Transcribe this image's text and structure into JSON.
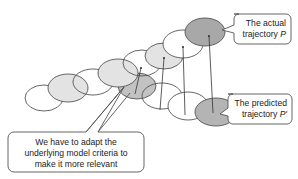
{
  "diagram": {
    "colors": {
      "stroke": "#555555",
      "white_fill": "#ffffff",
      "light_fill": "#e4e4e4",
      "dark_fill": "#a8a8a8",
      "callout_border": "#555555",
      "text": "#222222"
    },
    "callouts": {
      "actual": {
        "line1": "The actual",
        "line2_prefix": "trajectory ",
        "line2_symbol": "P"
      },
      "predicted": {
        "line1": "The predicted",
        "line2_prefix": "trajectory ",
        "line2_symbol": "P'"
      },
      "adapt": {
        "line1": "We have to adapt the",
        "line2": "underlying model criteria to",
        "line3": "make it more relevant"
      }
    },
    "labels": {
      "actual_trajectory": "The actual trajectory P",
      "predicted_trajectory": "The predicted trajectory P'"
    }
  }
}
